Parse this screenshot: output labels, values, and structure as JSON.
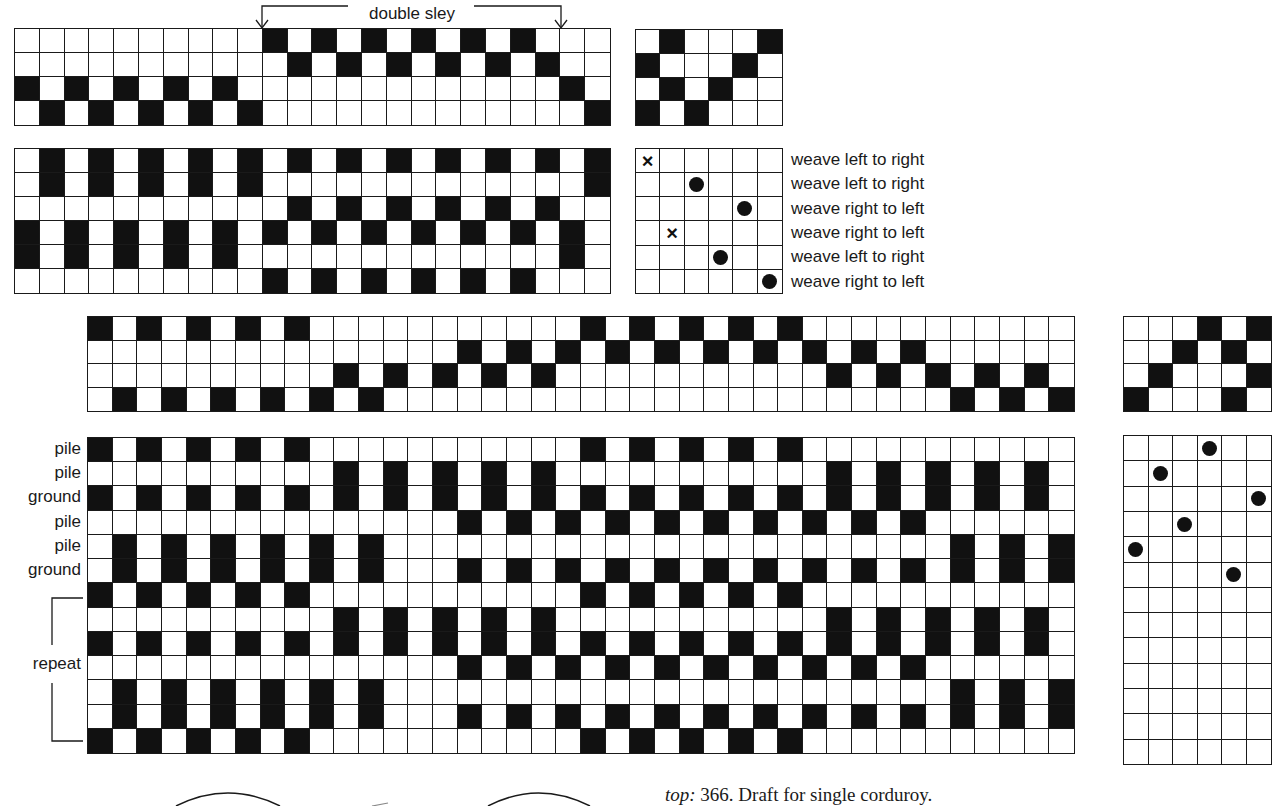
{
  "annotation": {
    "double_sley_label": "double sley"
  },
  "figure1": {
    "threading": {
      "cols": 24,
      "rows": 4,
      "filled": [
        [
          11,
          13,
          15,
          17,
          19,
          21
        ],
        [
          12,
          14,
          16,
          18,
          20,
          22
        ],
        [
          1,
          3,
          5,
          7,
          9,
          23
        ],
        [
          2,
          4,
          6,
          8,
          10,
          24
        ]
      ]
    },
    "tieup": {
      "cols": 6,
      "rows": 4,
      "filled": [
        [
          2,
          6
        ],
        [
          1,
          5
        ],
        [
          2,
          4
        ],
        [
          1,
          3
        ]
      ]
    },
    "drawdown": {
      "cols": 24,
      "rows": 6,
      "filled": [
        [
          2,
          4,
          6,
          8,
          10,
          12,
          14,
          16,
          18,
          20,
          22,
          24
        ],
        [
          2,
          4,
          6,
          8,
          10,
          24
        ],
        [
          12,
          14,
          16,
          18,
          20,
          22
        ],
        [
          1,
          3,
          5,
          7,
          9,
          11,
          13,
          15,
          17,
          19,
          21,
          23
        ],
        [
          1,
          3,
          5,
          7,
          9,
          23
        ],
        [
          11,
          13,
          15,
          17,
          19,
          21
        ]
      ]
    },
    "treadling": {
      "cols": 6,
      "rows": 6,
      "marks": [
        {
          "row": 1,
          "col": 1,
          "type": "x"
        },
        {
          "row": 2,
          "col": 3,
          "type": "dot"
        },
        {
          "row": 3,
          "col": 5,
          "type": "dot"
        },
        {
          "row": 4,
          "col": 2,
          "type": "x"
        },
        {
          "row": 5,
          "col": 4,
          "type": "dot"
        },
        {
          "row": 6,
          "col": 6,
          "type": "dot"
        }
      ]
    },
    "weave_directions": [
      "weave left to right",
      "weave left to right",
      "weave right to left",
      "weave right to left",
      "weave left to right",
      "weave right to left"
    ]
  },
  "figure2": {
    "threading": {
      "cols": 40,
      "rows": 4,
      "filled": [
        [
          1,
          3,
          5,
          7,
          9,
          21,
          23,
          25,
          27,
          29
        ],
        [
          16,
          18,
          20,
          22,
          24,
          26,
          28,
          30,
          32,
          34
        ],
        [
          11,
          13,
          15,
          17,
          19,
          31,
          33,
          35,
          37,
          39
        ],
        [
          2,
          4,
          6,
          8,
          10,
          12,
          36,
          38,
          40
        ]
      ]
    },
    "tieup": {
      "cols": 6,
      "rows": 4,
      "filled": [
        [
          4,
          6
        ],
        [
          3,
          5
        ],
        [
          2,
          6
        ],
        [
          1,
          5
        ]
      ]
    },
    "drawdown": {
      "cols": 40,
      "rows": 13,
      "filled": [
        [
          1,
          3,
          5,
          7,
          9,
          21,
          23,
          25,
          27,
          29
        ],
        [
          11,
          13,
          15,
          17,
          19,
          31,
          33,
          35,
          37,
          39
        ],
        [
          1,
          3,
          5,
          7,
          9,
          11,
          13,
          15,
          17,
          19,
          21,
          23,
          25,
          27,
          29,
          31,
          33,
          35,
          37,
          39
        ],
        [
          16,
          18,
          20,
          22,
          24,
          26,
          28,
          30,
          32,
          34
        ],
        [
          2,
          4,
          6,
          8,
          10,
          12,
          36,
          38,
          40
        ],
        [
          2,
          4,
          6,
          8,
          10,
          12,
          16,
          18,
          20,
          22,
          24,
          26,
          28,
          30,
          32,
          34,
          36,
          38,
          40
        ],
        [
          1,
          3,
          5,
          7,
          9,
          21,
          23,
          25,
          27,
          29
        ],
        [
          11,
          13,
          15,
          17,
          19,
          31,
          33,
          35,
          37,
          39
        ],
        [
          1,
          3,
          5,
          7,
          9,
          11,
          13,
          15,
          17,
          19,
          21,
          23,
          25,
          27,
          29,
          31,
          33,
          35,
          37,
          39
        ],
        [
          16,
          18,
          20,
          22,
          24,
          26,
          28,
          30,
          32,
          34
        ],
        [
          2,
          4,
          6,
          8,
          10,
          12,
          36,
          38,
          40
        ],
        [
          2,
          4,
          6,
          8,
          10,
          12,
          16,
          18,
          20,
          22,
          24,
          26,
          28,
          30,
          32,
          34,
          36,
          38,
          40
        ],
        [
          1,
          3,
          5,
          7,
          9,
          21,
          23,
          25,
          27,
          29
        ]
      ]
    },
    "treadling": {
      "cols": 6,
      "rows": 13,
      "marks": [
        {
          "row": 1,
          "col": 4,
          "type": "dot"
        },
        {
          "row": 2,
          "col": 2,
          "type": "dot"
        },
        {
          "row": 3,
          "col": 6,
          "type": "dot"
        },
        {
          "row": 4,
          "col": 3,
          "type": "dot"
        },
        {
          "row": 5,
          "col": 1,
          "type": "dot"
        },
        {
          "row": 6,
          "col": 5,
          "type": "dot"
        }
      ]
    },
    "pick_labels": [
      "pile",
      "pile",
      "ground",
      "pile",
      "pile",
      "ground"
    ],
    "repeat_label": "repeat"
  },
  "caption": {
    "prefix": "top:",
    "text": "366. Draft for single corduroy."
  }
}
